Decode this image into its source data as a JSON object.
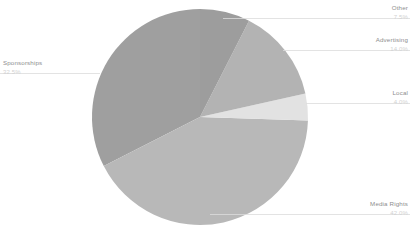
{
  "chart_data": {
    "type": "pie",
    "title": "",
    "subtitle": "",
    "xlabel": "",
    "ylabel": "",
    "legend_position": "none",
    "labels_position": "outside-leader-lines",
    "grid": false,
    "categories": [
      "Other",
      "Advertising",
      "Local",
      "Media Rights",
      "Sponsorships"
    ],
    "values": [
      7.5,
      14.0,
      4.0,
      42.0,
      32.5
    ],
    "value_unit": "%",
    "start_angle_deg": 0,
    "direction": "clockwise",
    "slices": [
      {
        "label": "Other",
        "percent_text": "7.5%",
        "value": 7.5,
        "color": "#9d9d9d",
        "start_deg": 0.0,
        "end_deg": 27.0
      },
      {
        "label": "Advertising",
        "percent_text": "14.0%",
        "value": 14.0,
        "color": "#b3b3b3",
        "start_deg": 27.0,
        "end_deg": 77.4
      },
      {
        "label": "Local",
        "percent_text": "4.0%",
        "value": 4.0,
        "color": "#e2e2e2",
        "start_deg": 77.4,
        "end_deg": 91.8
      },
      {
        "label": "Media Rights",
        "percent_text": "42.0%",
        "value": 42.0,
        "color": "#b8b8b8",
        "start_deg": 91.8,
        "end_deg": 243.0
      },
      {
        "label": "Sponsorships",
        "percent_text": "32.5%",
        "value": 32.5,
        "color": "#9f9f9f",
        "start_deg": 243.0,
        "end_deg": 360.0
      }
    ]
  },
  "labels": {
    "other": {
      "name": "Other",
      "percent": "7.5%"
    },
    "advertising": {
      "name": "Advertising",
      "percent": "14.0%"
    },
    "local": {
      "name": "Local",
      "percent": "4.0%"
    },
    "media_rights": {
      "name": "Media Rights",
      "percent": "42.0%"
    },
    "sponsorships": {
      "name": "Sponsorships",
      "percent": "32.5%"
    }
  },
  "style": {
    "background": "#ffffff",
    "leader_line_color": "#dcdcdc",
    "label_text_color": "#8e8e8e",
    "percent_text_color": "#d2d2d2"
  }
}
